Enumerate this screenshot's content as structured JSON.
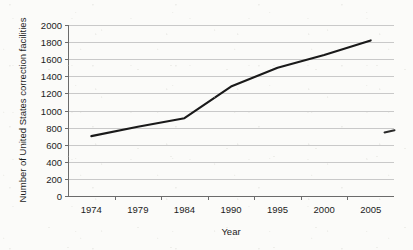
{
  "chart_data": {
    "type": "line",
    "title": "",
    "xlabel": "Year",
    "ylabel": "Number of United States correction facilities",
    "categories": [
      "1974",
      "1979",
      "1984",
      "1990",
      "1995",
      "2000",
      "2005"
    ],
    "x": [
      1974,
      1979,
      1984,
      1990,
      1995,
      2000,
      2005
    ],
    "values": [
      700,
      810,
      910,
      1280,
      1500,
      1650,
      1820
    ],
    "series": [
      {
        "name": "Number of United States correction facilities",
        "values": [
          700,
          810,
          910,
          1280,
          1500,
          1650,
          1820
        ]
      }
    ],
    "ylim": [
      0,
      2000
    ],
    "ytick_labels": [
      "0",
      "200",
      "400",
      "600",
      "800",
      "1000",
      "1200",
      "1400",
      "1600",
      "1800",
      "2000"
    ],
    "ytick_values": [
      0,
      200,
      400,
      600,
      800,
      1000,
      1200,
      1400,
      1600,
      1800,
      2000
    ],
    "xtick_labels": [
      "1974",
      "1979",
      "1984",
      "1990",
      "1995",
      "2000",
      "2005"
    ],
    "grid": "horizontal",
    "legend": "none",
    "line_color": "#1a1a1a",
    "grid_color": "#c9c9c9",
    "axis_color": "#6b6b6b",
    "background_color": "#fbfbf9",
    "annotations": []
  },
  "figure": {
    "plot_left_px": 68,
    "plot_right_px": 394,
    "plot_top_px": 25,
    "plot_bottom_px": 196
  }
}
